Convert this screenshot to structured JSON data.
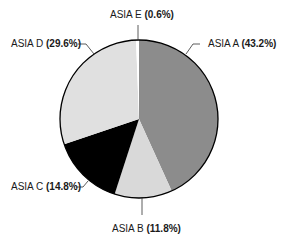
{
  "chart_data": {
    "type": "pie",
    "title": "",
    "start_angle": "12 o'clock",
    "direction": "clockwise",
    "slices": [
      {
        "label": "ASIA A",
        "value": 43.2,
        "display": "(43.2%)",
        "color": "#8c8c8c"
      },
      {
        "label": "ASIA B",
        "value": 11.8,
        "display": "(11.8%)",
        "color": "#d9d9d9"
      },
      {
        "label": "ASIA C",
        "value": 14.8,
        "display": "(14.8%)",
        "color": "#000000"
      },
      {
        "label": "ASIA D",
        "value": 29.6,
        "display": "(29.6%)",
        "color": "#e0e0e0"
      },
      {
        "label": "ASIA E",
        "value": 0.6,
        "display": "(0.6%)",
        "color": "#ffffff"
      }
    ],
    "outline_color": "#000000",
    "legend": "none (direct labels with leader lines)"
  },
  "labels": {
    "a": {
      "name": "ASIA A",
      "pct": "(43.2%)"
    },
    "b": {
      "name": "ASIA B",
      "pct": "(11.8%)"
    },
    "c": {
      "name": "ASIA C",
      "pct": "(14.8%)"
    },
    "d": {
      "name": "ASIA D",
      "pct": "(29.6%)"
    },
    "e": {
      "name": "ASIA E",
      "pct": "(0.6%)"
    }
  }
}
